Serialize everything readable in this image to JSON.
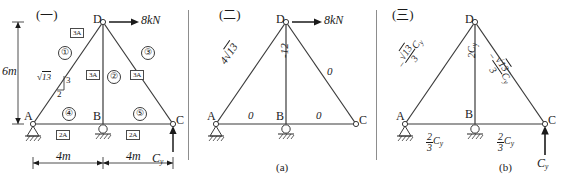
{
  "figure": {
    "panels": [
      {
        "header": "(一)",
        "caption": "",
        "nodes": [
          "A",
          "B",
          "C",
          "D"
        ],
        "load": "8kN",
        "reaction": "C",
        "reaction_sub": "y",
        "dim_vertical": "6m",
        "dim_left": "4m",
        "dim_right": "4m",
        "slope_hyp": "13",
        "slope_rise": "3",
        "slope_run": "2",
        "members": [
          {
            "num": "①",
            "area": "3A"
          },
          {
            "num": "②",
            "area": "3A"
          },
          {
            "num": "③",
            "area": "3A"
          },
          {
            "num": "④",
            "area": "2A"
          },
          {
            "num": "⑤",
            "area": "2A"
          }
        ]
      },
      {
        "header": "(二)",
        "caption": "(a)",
        "nodes": [
          "A",
          "B",
          "C",
          "D"
        ],
        "load": "8kN",
        "forces": {
          "ad": "4",
          "ad_rad": "13",
          "bd": "-12",
          "cd": "0",
          "ab": "0",
          "bc": "0"
        }
      },
      {
        "header": "(三)",
        "caption": "(b)",
        "nodes": [
          "A",
          "B",
          "C",
          "D"
        ],
        "reaction": "C",
        "reaction_sub": "y",
        "forces": {
          "ad_sign": "−",
          "ad_num": "13",
          "ad_den": "3",
          "ad_var": "C",
          "ad_var_sub": "y",
          "bd": "2C",
          "bd_sub": "y",
          "cd_sign": "−",
          "cd_num": "13",
          "cd_den": "3",
          "cd_var": "C",
          "cd_var_sub": "y",
          "ab_num": "2",
          "ab_den": "3",
          "ab_var": "C",
          "ab_var_sub": "y",
          "bc_num": "2",
          "bc_den": "3",
          "bc_var": "C",
          "bc_var_sub": "y"
        }
      }
    ]
  },
  "colors": {
    "line": "#3a3a3a",
    "text": "#1a1a1a"
  }
}
